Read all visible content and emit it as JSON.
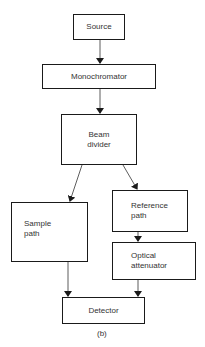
{
  "diagram": {
    "nodes": {
      "source": {
        "label": "Source"
      },
      "monochromator": {
        "label": "Monochromator"
      },
      "beam_divider": {
        "line1": "Beam",
        "line2": "divider"
      },
      "sample_path": {
        "line1": "Sample",
        "line2": "path"
      },
      "reference_path": {
        "line1": "Reference",
        "line2": "path"
      },
      "optical_attenuator": {
        "line1": "Optical",
        "line2": "attenuator"
      },
      "detector": {
        "label": "Detector"
      }
    },
    "edges": [
      {
        "from": "source",
        "to": "monochromator"
      },
      {
        "from": "monochromator",
        "to": "beam_divider"
      },
      {
        "from": "beam_divider",
        "to": "sample_path"
      },
      {
        "from": "beam_divider",
        "to": "reference_path"
      },
      {
        "from": "reference_path",
        "to": "optical_attenuator"
      },
      {
        "from": "sample_path",
        "to": "detector"
      },
      {
        "from": "optical_attenuator",
        "to": "detector"
      }
    ],
    "caption": "(b)"
  }
}
